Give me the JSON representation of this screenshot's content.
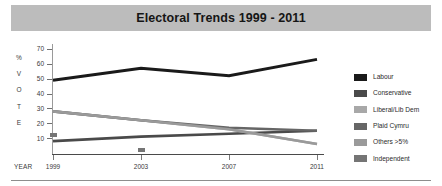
{
  "title": "Electoral Trends 1999 - 2011",
  "axis_value_label_chars": [
    "%",
    "V",
    "O",
    "T",
    "E"
  ],
  "year_axis_label": "YEAR",
  "legend": [
    {
      "label": "Labour",
      "color": "#1a1a1a"
    },
    {
      "label": "Conservative",
      "color": "#4a4a4a"
    },
    {
      "label": "Liberal/Lib Dem",
      "color": "#a8a8a8"
    },
    {
      "label": "Plaid Cymru",
      "color": "#666666"
    },
    {
      "label": "Others >5%",
      "color": "#9a9a9a"
    },
    {
      "label": "Independent",
      "color": "#757575"
    }
  ],
  "chart_data": {
    "type": "line",
    "title": "Electoral Trends 1999 - 2011",
    "xlabel": "YEAR",
    "ylabel": "% VOTE",
    "categories": [
      "1999",
      "2003",
      "2007",
      "2011"
    ],
    "yticks": [
      70,
      60,
      50,
      40,
      30,
      20,
      10
    ],
    "ylim": [
      0,
      72
    ],
    "grid": false,
    "legend_position": "right",
    "series": [
      {
        "name": "Labour",
        "color": "#1a1a1a",
        "values": [
          49,
          57,
          52,
          63
        ]
      },
      {
        "name": "Conservative",
        "color": "#4a4a4a",
        "values": [
          8,
          11,
          13,
          15
        ]
      },
      {
        "name": "Liberal/Lib Dem",
        "color": "#a8a8a8",
        "values": [
          28,
          22,
          16,
          6
        ]
      },
      {
        "name": "Plaid Cymru",
        "color": "#666666",
        "values": [
          28,
          22,
          17,
          15
        ]
      },
      {
        "name": "Others >5%",
        "color": "#9a9a9a",
        "values": [
          28,
          22,
          16,
          6
        ]
      },
      {
        "name": "Independent",
        "color": "#757575",
        "type": "markers",
        "values": [
          12,
          2,
          null,
          null
        ]
      }
    ]
  }
}
